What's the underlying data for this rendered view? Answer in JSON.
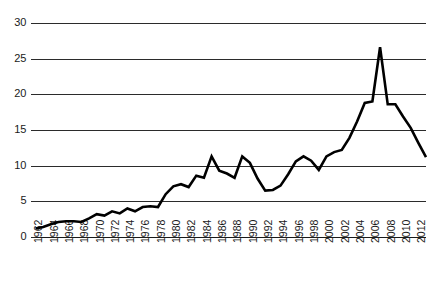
{
  "chart_data": {
    "type": "line",
    "title": "",
    "subtitle": "",
    "xlabel": "",
    "ylabel": "",
    "grid": "horizontal",
    "legend": "none",
    "xlim": [
      1962,
      2013
    ],
    "ylim": [
      0,
      30
    ],
    "yticks": [
      0,
      5,
      10,
      15,
      20,
      25,
      30
    ],
    "ytick_labels": [
      "0",
      "5",
      "10",
      "15",
      "20",
      "25",
      "30"
    ],
    "xticks": [
      1962,
      1964,
      1966,
      1968,
      1970,
      1972,
      1974,
      1976,
      1978,
      1980,
      1982,
      1984,
      1986,
      1988,
      1990,
      1992,
      1994,
      1996,
      1998,
      2000,
      2002,
      2004,
      2006,
      2008,
      2010,
      2012
    ],
    "xtick_labels": [
      "1962",
      "1964",
      "1966",
      "1968",
      "1970",
      "1972",
      "1974",
      "1976",
      "1978",
      "1980",
      "1982",
      "1984",
      "1986",
      "1988",
      "1990",
      "1992",
      "1994",
      "1996",
      "1998",
      "2000",
      "2002",
      "2004",
      "2006",
      "2008",
      "2010",
      "2012"
    ],
    "x": [
      1962,
      1963,
      1964,
      1965,
      1966,
      1967,
      1968,
      1969,
      1970,
      1971,
      1972,
      1973,
      1974,
      1975,
      1976,
      1977,
      1978,
      1979,
      1980,
      1981,
      1982,
      1983,
      1984,
      1985,
      1986,
      1987,
      1988,
      1989,
      1990,
      1991,
      1992,
      1993,
      1994,
      1995,
      1996,
      1997,
      1998,
      1999,
      2000,
      2001,
      2002,
      2003,
      2004,
      2005,
      2006,
      2007,
      2008,
      2009,
      2010,
      2011,
      2012,
      2013
    ],
    "values": [
      1.2,
      1.4,
      1.8,
      2.1,
      2.2,
      2.2,
      2.1,
      2.6,
      3.2,
      3.0,
      3.6,
      3.3,
      4.0,
      3.6,
      4.2,
      4.3,
      4.2,
      6.0,
      7.1,
      7.4,
      7.0,
      8.6,
      8.3,
      11.3,
      9.3,
      8.9,
      8.3,
      11.3,
      10.4,
      8.2,
      6.5,
      6.6,
      7.2,
      8.8,
      10.6,
      11.3,
      10.7,
      9.4,
      11.3,
      11.9,
      12.2,
      13.9,
      16.2,
      18.8,
      19.0,
      26.6,
      18.6,
      18.6,
      16.9,
      15.3,
      13.2,
      11.2
    ],
    "series": [
      {
        "name": "series-1",
        "values": [
          1.2,
          1.4,
          1.8,
          2.1,
          2.2,
          2.2,
          2.1,
          2.6,
          3.2,
          3.0,
          3.6,
          3.3,
          4.0,
          3.6,
          4.2,
          4.3,
          4.2,
          6.0,
          7.1,
          7.4,
          7.0,
          8.6,
          8.3,
          11.3,
          9.3,
          8.9,
          8.3,
          11.3,
          10.4,
          8.2,
          6.5,
          6.6,
          7.2,
          8.8,
          10.6,
          11.3,
          10.7,
          9.4,
          11.3,
          11.9,
          12.2,
          13.9,
          16.2,
          18.8,
          19.0,
          26.6,
          18.6,
          18.6,
          16.9,
          15.3,
          13.2,
          11.2
        ]
      }
    ],
    "colors": {
      "line": "#000000",
      "grid": "#2b2b2b",
      "axis": "#1a1a1a",
      "text": "#1a1a1a",
      "background": "#ffffff"
    }
  }
}
